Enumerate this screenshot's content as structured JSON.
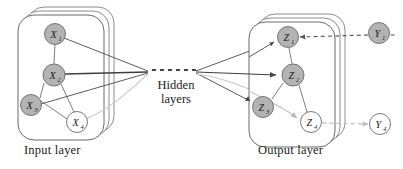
{
  "figure": {
    "type": "neural-network-diagram",
    "width": 403,
    "height": 169,
    "background": "#ffffff"
  },
  "labels": {
    "input_layer": "Input layer",
    "hidden_layers_line1": "Hidden",
    "hidden_layers_line2": "layers",
    "output_layer": "Output layer"
  },
  "colors": {
    "node_filled": "#b3b3b3",
    "node_empty": "#ffffff",
    "node_stroke": "#6b6b6b",
    "card_stroke": "#5a5a5a",
    "edge": "#4a4a4a",
    "edge_light": "#c8c8c8",
    "dashed": "#555555",
    "dashed_light": "#bcbcbc",
    "text": "#1c1c1c"
  },
  "input_layer": {
    "card_count": 3,
    "nodes": [
      {
        "id": "X1",
        "base": "X",
        "sub": "1",
        "cx": 55,
        "cy": 34,
        "r": 10.5,
        "filled": true
      },
      {
        "id": "X2",
        "base": "X",
        "sub": "2",
        "cx": 54,
        "cy": 75,
        "r": 11.0,
        "filled": true
      },
      {
        "id": "X3",
        "base": "X",
        "sub": "3",
        "cx": 31,
        "cy": 105,
        "r": 10.5,
        "filled": true
      },
      {
        "id": "X4",
        "base": "X",
        "sub": "4",
        "cx": 77,
        "cy": 122,
        "r": 10.5,
        "filled": false
      }
    ]
  },
  "output_layer": {
    "card_count": 3,
    "nodes": [
      {
        "id": "Z1",
        "base": "Z",
        "sub": "1",
        "cx": 288,
        "cy": 37,
        "r": 10.5,
        "filled": true
      },
      {
        "id": "Z2",
        "base": "Z",
        "sub": "2",
        "cx": 293,
        "cy": 75,
        "r": 11.0,
        "filled": true
      },
      {
        "id": "Z3",
        "base": "Z",
        "sub": "3",
        "cx": 263,
        "cy": 107,
        "r": 10.5,
        "filled": true
      },
      {
        "id": "Z4",
        "base": "Z",
        "sub": "4",
        "cx": 311,
        "cy": 122,
        "r": 10.5,
        "filled": false
      }
    ]
  },
  "response_nodes": [
    {
      "id": "Y1",
      "base": "Y",
      "sub": "1",
      "cx": 379,
      "cy": 33,
      "r": 10.5,
      "filled": true
    },
    {
      "id": "Y4",
      "base": "Y",
      "sub": "4",
      "cx": 380,
      "cy": 124,
      "r": 10.5,
      "filled": false
    }
  ],
  "hidden_layers_marker": {
    "style": "dashed-line",
    "x1": 152,
    "x2": 196,
    "y": 70
  },
  "convergence_point": {
    "x": 148,
    "y": 72
  },
  "divergence_point": {
    "x": 196,
    "y": 72
  }
}
